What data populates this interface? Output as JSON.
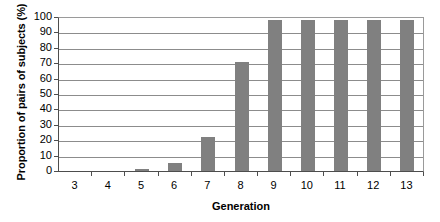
{
  "chart_data": {
    "type": "bar",
    "title": "",
    "xlabel": "Generation",
    "ylabel": "Proportion of pairs of subjects (%)",
    "categories": [
      "3",
      "4",
      "5",
      "6",
      "7",
      "8",
      "9",
      "10",
      "11",
      "12",
      "13"
    ],
    "values": [
      0,
      0,
      1,
      5,
      22,
      71,
      98,
      98,
      98,
      98,
      98
    ],
    "ylim": [
      0,
      100
    ],
    "yticks": [
      0,
      10,
      20,
      30,
      40,
      50,
      60,
      70,
      80,
      90,
      100
    ],
    "ytick_labels": [
      "0",
      "10",
      "20",
      "30",
      "40",
      "50",
      "60",
      "70",
      "80",
      "90",
      "100"
    ],
    "grid": true,
    "legend": "none",
    "series_color": "#808080",
    "axis_color": "#4d4d4d",
    "grid_color": "#8c8c8c",
    "background": "#ffffff"
  }
}
